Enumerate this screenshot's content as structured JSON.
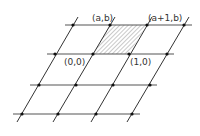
{
  "diagram": {
    "type": "lattice",
    "colors": {
      "background": "#ffffff",
      "lines": "#444444",
      "points": "#111111",
      "hatch": "#777777"
    },
    "rows": [
      {
        "y": 25,
        "x_start": 65,
        "x_end": 192,
        "points": [
          73,
          110,
          147,
          184
        ]
      },
      {
        "y": 54,
        "x_start": 47,
        "x_end": 174,
        "points": [
          55,
          93,
          129,
          167
        ]
      },
      {
        "y": 85,
        "x_start": 30,
        "x_end": 157,
        "points": [
          39,
          76,
          113,
          150
        ]
      },
      {
        "y": 114,
        "x_start": 13,
        "x_end": 140,
        "points": [
          22,
          58,
          96,
          132
        ]
      }
    ],
    "slanted_lines": [
      {
        "x1": 17,
        "y1": 122,
        "x2": 78,
        "y2": 17
      },
      {
        "x1": 53,
        "y1": 122,
        "x2": 115,
        "y2": 17
      },
      {
        "x1": 91,
        "y1": 122,
        "x2": 152,
        "y2": 17
      },
      {
        "x1": 127,
        "y1": 122,
        "x2": 189,
        "y2": 17
      }
    ],
    "shaded_cell": {
      "points": "93,54 129,54 147,25 110,25",
      "pattern": "diagonal-hatch"
    },
    "labels": [
      {
        "id": "label-a-b",
        "text": "(a,b)",
        "x": 92,
        "y": 21
      },
      {
        "id": "label-a1-b",
        "text": "(a+1,b)",
        "x": 148,
        "y": 21
      },
      {
        "id": "label-0-0",
        "text": "(0,0)",
        "x": 64,
        "y": 65
      },
      {
        "id": "label-1-0",
        "text": "(1,0)",
        "x": 130,
        "y": 65
      }
    ]
  }
}
